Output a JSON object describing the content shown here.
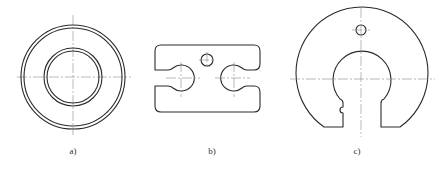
{
  "figures": [
    {
      "id": "a",
      "label": "a)",
      "description": "Annular washer: two concentric double-line circles with crossing centerlines"
    },
    {
      "id": "b",
      "label": "b)",
      "description": "Rounded rectangular plate with two opposing keyhole slots and a small central hole"
    },
    {
      "id": "c",
      "label": "c)",
      "description": "Open circular plate with mushroom-shaped cutout, small side notch and a small top hole"
    }
  ],
  "colors": {
    "outline": "#2a2a2a",
    "centerline": "#8a8a8a",
    "background": "#ffffff"
  }
}
